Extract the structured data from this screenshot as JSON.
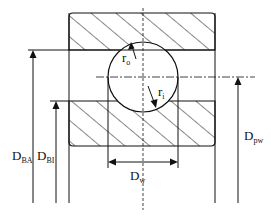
{
  "diagram": {
    "labels": {
      "ro": {
        "main": "r",
        "sub": "o"
      },
      "ri": {
        "main": "r",
        "sub": "i"
      },
      "dba": {
        "main": "D",
        "sub": "BA"
      },
      "dbi": {
        "main": "D",
        "sub": "BI"
      },
      "dpw": {
        "main": "D",
        "sub": "pw"
      },
      "dw": {
        "main": "D",
        "sub": "w"
      }
    },
    "colors": {
      "line": "#111111",
      "background": "#ffffff"
    }
  }
}
